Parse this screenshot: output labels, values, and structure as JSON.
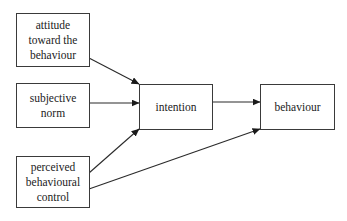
{
  "diagram": {
    "type": "flowchart",
    "nodes": [
      {
        "id": "attitude",
        "label": "attitude\ntoward the\nbehaviour"
      },
      {
        "id": "norm",
        "label": "subjective\nnorm"
      },
      {
        "id": "pbc",
        "label": "perceived\nbehavioural\ncontrol"
      },
      {
        "id": "intention",
        "label": "intention"
      },
      {
        "id": "behaviour",
        "label": "behaviour"
      }
    ],
    "edges": [
      {
        "from": "attitude",
        "to": "intention"
      },
      {
        "from": "norm",
        "to": "intention"
      },
      {
        "from": "pbc",
        "to": "intention"
      },
      {
        "from": "intention",
        "to": "behaviour"
      },
      {
        "from": "pbc",
        "to": "behaviour"
      }
    ],
    "colors": {
      "stroke": "#2a2a2a",
      "background": "#ffffff",
      "text": "#222222"
    }
  }
}
